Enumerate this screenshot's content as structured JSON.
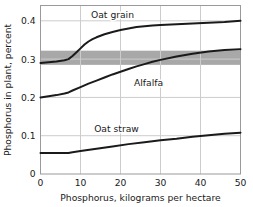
{
  "chart_data": {
    "type": "line",
    "title": "",
    "xlabel": "Phosphorus, kilograms per hectare",
    "ylabel": "Phosphorus in plant, percent",
    "xlim": [
      0,
      50
    ],
    "ylim": [
      0,
      0.44
    ],
    "xticks": [
      0,
      10,
      20,
      30,
      40,
      50
    ],
    "xticklabels": [
      "0",
      "10",
      "20",
      "30",
      "40",
      "50"
    ],
    "yticks": [
      0,
      0.1,
      0.2,
      0.3,
      0.4
    ],
    "yticklabels": [
      "0",
      "0.1",
      "0.2",
      "0.3",
      "0.4"
    ],
    "grid": true,
    "grid_color": "#cccccc",
    "legend_position": "inline-annotations",
    "line_color": "#1a1a1a",
    "band": {
      "label": "critical range",
      "y_low": 0.285,
      "y_high": 0.322,
      "color": "#a8a8a8"
    },
    "series": [
      {
        "name": "Oat grain",
        "label_x": 18,
        "label_y": 0.415,
        "x": [
          0,
          2,
          4,
          6,
          7,
          8,
          9,
          10,
          11,
          12,
          13,
          14,
          16,
          18,
          20,
          22,
          24,
          26,
          28,
          30,
          34,
          38,
          42,
          46,
          50
        ],
        "values": [
          0.29,
          0.292,
          0.294,
          0.297,
          0.3,
          0.308,
          0.318,
          0.328,
          0.338,
          0.346,
          0.352,
          0.357,
          0.365,
          0.371,
          0.376,
          0.38,
          0.384,
          0.386,
          0.388,
          0.389,
          0.391,
          0.393,
          0.395,
          0.397,
          0.4
        ]
      },
      {
        "name": "Alfalfa",
        "label_x": 27,
        "label_y": 0.238,
        "x": [
          0,
          2,
          4,
          6,
          7,
          8,
          10,
          12,
          14,
          16,
          18,
          20,
          22,
          24,
          26,
          28,
          30,
          34,
          38,
          42,
          46,
          50
        ],
        "values": [
          0.2,
          0.203,
          0.206,
          0.21,
          0.213,
          0.218,
          0.227,
          0.236,
          0.244,
          0.252,
          0.26,
          0.267,
          0.274,
          0.281,
          0.287,
          0.293,
          0.298,
          0.307,
          0.314,
          0.32,
          0.324,
          0.326
        ]
      },
      {
        "name": "Oat straw",
        "label_x": 19,
        "label_y": 0.118,
        "x": [
          0,
          2,
          4,
          6,
          7,
          8,
          10,
          14,
          18,
          22,
          26,
          30,
          34,
          38,
          42,
          46,
          50
        ],
        "values": [
          0.055,
          0.055,
          0.055,
          0.055,
          0.055,
          0.057,
          0.06,
          0.066,
          0.072,
          0.078,
          0.083,
          0.088,
          0.092,
          0.097,
          0.101,
          0.105,
          0.108
        ]
      }
    ]
  }
}
